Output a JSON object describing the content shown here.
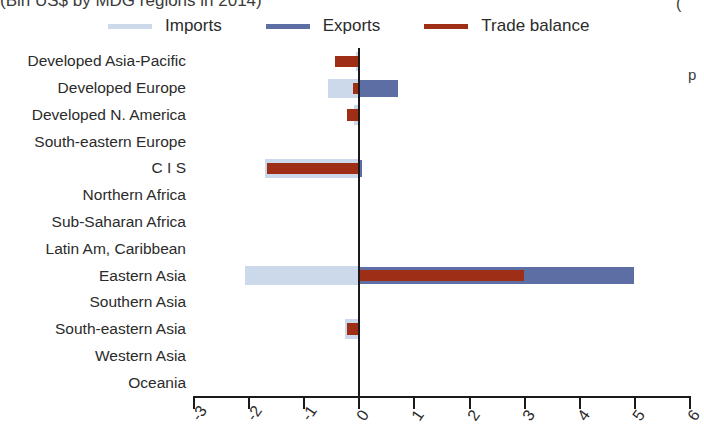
{
  "title": "(Bln US$ by MDG regions in 2014)",
  "edge_text": {
    "top_right": "(",
    "side_right": "p"
  },
  "legend": {
    "position": "top",
    "items": [
      {
        "label": "Imports",
        "color": "#ccd9ea",
        "icon": "line-swatch"
      },
      {
        "label": "Exports",
        "color": "#5d6ea4",
        "icon": "line-swatch"
      },
      {
        "label": "Trade balance",
        "color": "#9e2f16",
        "icon": "line-swatch"
      }
    ]
  },
  "chart_data": {
    "type": "bar",
    "orientation": "horizontal",
    "title": "(Bln US$ by MDG regions in 2014)",
    "xlabel": "",
    "ylabel": "",
    "xlim": [
      -3,
      6
    ],
    "xticks": [
      -3,
      -2,
      -1,
      0,
      1,
      2,
      3,
      4,
      5,
      6
    ],
    "xticklabels": [
      "-3",
      "-2",
      "-1",
      "0",
      "1",
      "2",
      "3",
      "4",
      "5",
      "6"
    ],
    "grid": false,
    "zero_line": 0,
    "categories": [
      "Developed Asia-Pacific",
      "Developed Europe",
      "Developed N. America",
      "South-eastern Europe",
      "C I S",
      "Northern Africa",
      "Sub-Saharan Africa",
      "Latin Am, Caribbean",
      "Eastern Asia",
      "Southern Asia",
      "South-eastern Asia",
      "Western Asia",
      "Oceania"
    ],
    "series": [
      {
        "name": "Imports",
        "color": "#ccd9ea",
        "values": [
          -0.05,
          -0.55,
          -0.08,
          0.0,
          -1.7,
          0.0,
          0.0,
          0.0,
          -2.05,
          0.0,
          -0.25,
          0.0,
          0.0
        ]
      },
      {
        "name": "Exports",
        "color": "#5d6ea4",
        "values": [
          0.0,
          0.72,
          0.0,
          0.0,
          0.07,
          0.0,
          0.0,
          0.0,
          5.0,
          0.0,
          0.02,
          0.0,
          0.0
        ]
      },
      {
        "name": "Trade balance",
        "color": "#9e2f16",
        "values": [
          -0.42,
          -0.1,
          -0.2,
          0.0,
          -1.65,
          0.0,
          0.0,
          0.0,
          3.0,
          0.0,
          -0.2,
          0.0,
          0.0
        ]
      }
    ]
  }
}
